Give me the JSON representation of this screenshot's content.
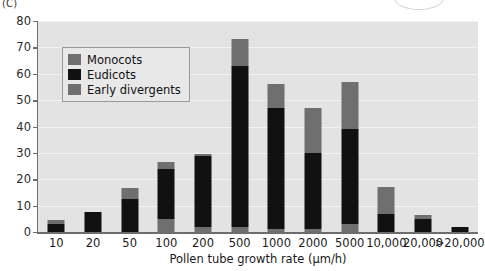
{
  "panel": {
    "label": "(C)"
  },
  "legend": {
    "items": [
      {
        "label": "Monocots",
        "color": "#6f6f6f",
        "key": "monocots"
      },
      {
        "label": "Eudicots",
        "color": "#111111",
        "key": "eudicots"
      },
      {
        "label": "Early divergents",
        "color": "#6f6f6f",
        "key": "early_divergents"
      }
    ]
  },
  "chart_data": {
    "type": "bar",
    "title": "",
    "subtitle": "",
    "xlabel": "Pollen tube growth rate (µm/h)",
    "ylabel": "Number of taxa",
    "categories": [
      "10",
      "20",
      "50",
      "100",
      "200",
      "500",
      "1000",
      "2000",
      "5000",
      "10,000",
      "20,000",
      ">20,000"
    ],
    "series": [
      {
        "name": "Early divergents",
        "color": "#6f6f6f",
        "values": [
          0,
          0,
          0,
          5,
          2,
          2,
          1,
          1,
          3,
          0,
          0,
          0
        ]
      },
      {
        "name": "Eudicots",
        "color": "#111111",
        "values": [
          3,
          7.5,
          12.5,
          19,
          27,
          61,
          46,
          29,
          36,
          7,
          5,
          2
        ]
      },
      {
        "name": "Monocots",
        "color": "#6f6f6f",
        "values": [
          1.5,
          0,
          4,
          2.5,
          0.5,
          10,
          9,
          17,
          18,
          10,
          1.5,
          0
        ]
      }
    ],
    "totals": [
      4.5,
      7.5,
      16.5,
      26.5,
      29.5,
      73,
      56,
      47,
      57,
      17,
      6.5,
      2
    ],
    "stack_order": [
      "Early divergents",
      "Eudicots",
      "Monocots"
    ],
    "ylim": [
      0,
      80
    ],
    "yticks": [
      0,
      10,
      20,
      30,
      40,
      50,
      60,
      70,
      80
    ],
    "ytick_labels": [
      "0",
      "10",
      "20",
      "30",
      "40",
      "50",
      "60",
      "70",
      "80"
    ],
    "grid": true,
    "legend_position": "upper left",
    "plot_background": "#e3e3e3",
    "axis_color": "#6d6d6d"
  }
}
